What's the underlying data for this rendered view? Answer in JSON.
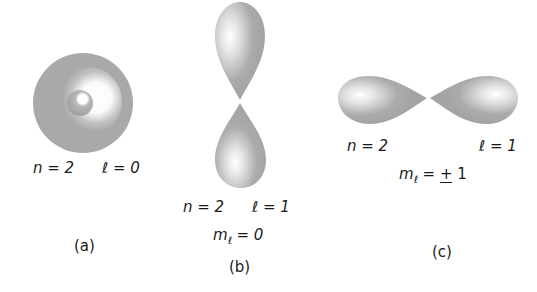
{
  "figure": {
    "panels": [
      {
        "id": "a",
        "caption": "(a)",
        "shape": "spherical orbital (2s)",
        "labels": {
          "n": "n = 2",
          "l": "ℓ = 0"
        }
      },
      {
        "id": "b",
        "caption": "(b)",
        "shape": "vertical dumbbell orbital (2p, m=0)",
        "labels": {
          "n": "n = 2",
          "l": "ℓ = 1",
          "m_prefix": "m",
          "m_sub": "ℓ",
          "m_value": " = 0"
        }
      },
      {
        "id": "c",
        "caption": "(c)",
        "shape": "horizontal dumbbell orbital (2p, m=±1)",
        "labels": {
          "n": "n = 2",
          "l": "ℓ = 1",
          "m_prefix": "m",
          "m_sub": "ℓ",
          "m_eq": " = ",
          "m_pm": "+",
          "m_value": " 1"
        }
      }
    ],
    "colors": {
      "orbital_gray": "#a9a9a9",
      "highlight": "#ffffff",
      "text": "#1a1a1a"
    }
  }
}
